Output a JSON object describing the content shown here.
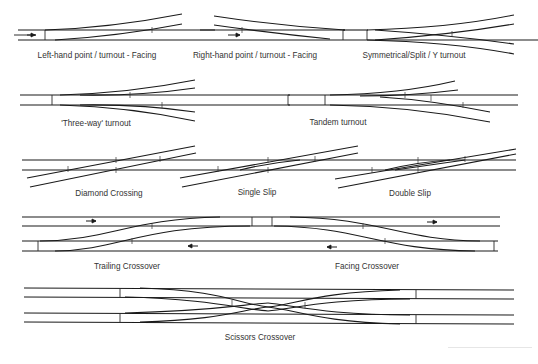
{
  "diagram": {
    "rows": [
      {
        "id": "row-1",
        "items": [
          {
            "name": "left-hand-turnout-facing",
            "label": "Left-hand point / turnout - Facing"
          },
          {
            "name": "right-hand-turnout-facing",
            "label": "Right-hand point / turnout - Facing"
          },
          {
            "name": "symmetrical-turnout",
            "label": "Symmetrical/Split / Y turnout"
          }
        ]
      },
      {
        "id": "row-2",
        "items": [
          {
            "name": "three-way-turnout",
            "label": "'Three-way' turnout"
          },
          {
            "name": "tandem-turnout",
            "label": "Tandem turnout"
          }
        ]
      },
      {
        "id": "row-3",
        "items": [
          {
            "name": "diamond-crossing",
            "label": "Diamond Crossing"
          },
          {
            "name": "single-slip",
            "label": "Single Slip"
          },
          {
            "name": "double-slip",
            "label": "Double Slip"
          }
        ]
      },
      {
        "id": "row-4",
        "items": [
          {
            "name": "trailing-crossover",
            "label": "Trailing Crossover"
          },
          {
            "name": "facing-crossover",
            "label": "Facing Crossover"
          }
        ]
      },
      {
        "id": "row-5",
        "items": [
          {
            "name": "scissors-crossover",
            "label": "Scissors Crossover"
          }
        ]
      }
    ],
    "arrows": [
      {
        "name": "direction-arrow-right",
        "direction": "right"
      },
      {
        "name": "direction-arrow-right",
        "direction": "right"
      },
      {
        "name": "direction-arrow-right",
        "direction": "right"
      },
      {
        "name": "direction-arrow-left",
        "direction": "left"
      },
      {
        "name": "direction-arrow-left",
        "direction": "left"
      }
    ],
    "colors": {
      "rail": "#1a1a1a",
      "label": "#333333",
      "background": "#ffffff"
    }
  }
}
